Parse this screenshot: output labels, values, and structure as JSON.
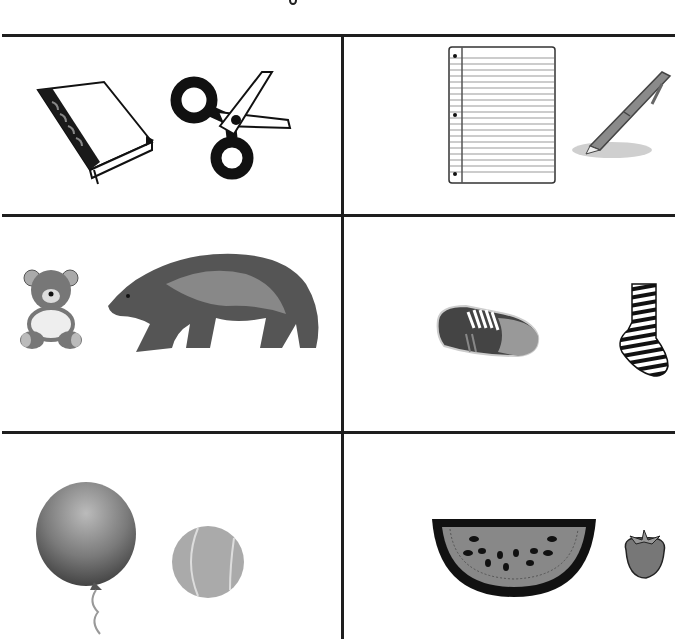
{
  "worksheet": {
    "type": "picture-pairs",
    "layout": {
      "columns": 2,
      "rows": 3
    },
    "line_color": "#1e1e1e",
    "cells": [
      {
        "row": 1,
        "col": 1,
        "items": [
          {
            "name": "book",
            "icon": "book-icon"
          },
          {
            "name": "scissors",
            "icon": "scissors-icon"
          }
        ]
      },
      {
        "row": 1,
        "col": 2,
        "items": [
          {
            "name": "notebook paper",
            "icon": "lined-paper-icon"
          },
          {
            "name": "pen",
            "icon": "pen-icon"
          }
        ]
      },
      {
        "row": 2,
        "col": 1,
        "items": [
          {
            "name": "teddy bear",
            "icon": "teddy-bear-icon"
          },
          {
            "name": "bear",
            "icon": "grizzly-bear-icon"
          }
        ]
      },
      {
        "row": 2,
        "col": 2,
        "items": [
          {
            "name": "shoe",
            "icon": "sneaker-icon"
          },
          {
            "name": "sock",
            "icon": "striped-sock-icon"
          }
        ]
      },
      {
        "row": 3,
        "col": 1,
        "items": [
          {
            "name": "balloon",
            "icon": "balloon-icon"
          },
          {
            "name": "ball",
            "icon": "tennis-ball-icon"
          }
        ]
      },
      {
        "row": 3,
        "col": 2,
        "items": [
          {
            "name": "watermelon",
            "icon": "watermelon-slice-icon"
          },
          {
            "name": "strawberry",
            "icon": "strawberry-icon"
          }
        ]
      }
    ]
  }
}
